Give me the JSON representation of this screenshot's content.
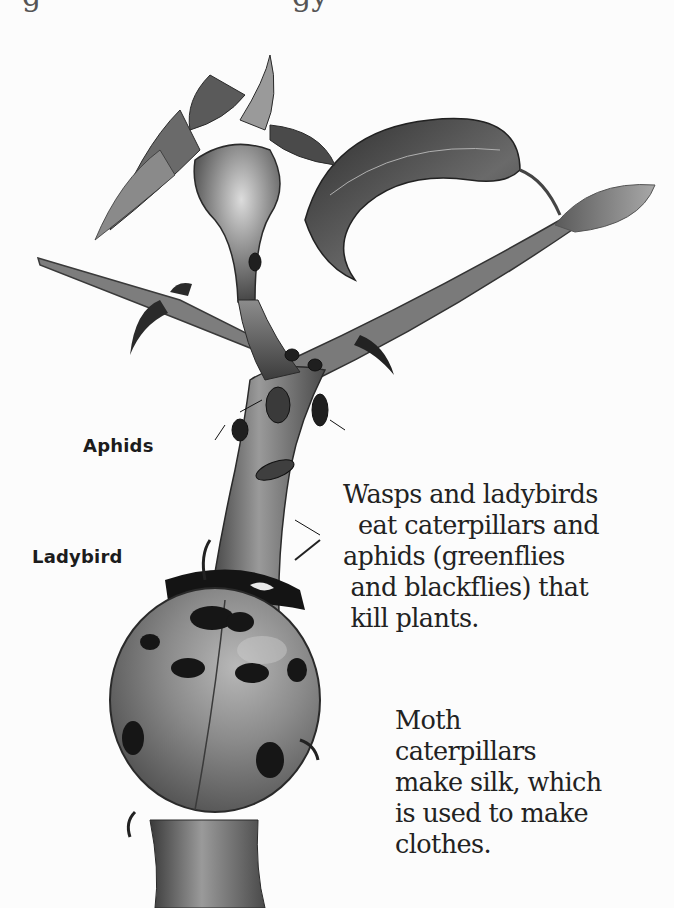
{
  "page": {
    "cutoff_top_text_fragments": [
      "g",
      "gy"
    ]
  },
  "illustration": {
    "subject": "rose stem with rosehip, leaves, aphids and a ladybird",
    "colors": {
      "background": "#fcfcfc",
      "ink_dark": "#1a1a1a",
      "mid_gray": "#6e6e6e",
      "light_gray": "#b5b5b5",
      "ladybird_shell": "#7a7a7a",
      "ladybird_spots": "#161616"
    }
  },
  "labels": {
    "aphids": "Aphids",
    "ladybird": "Ladybird"
  },
  "captions": {
    "predators": {
      "lines": [
        "Wasps and ladybirds",
        "  eat caterpillars and",
        "aphids (greenflies",
        " and blackflies) that",
        " kill plants."
      ]
    },
    "silk": {
      "lines": [
        "Moth",
        "caterpillars",
        "make silk, which",
        "is used to make",
        "clothes."
      ]
    }
  }
}
